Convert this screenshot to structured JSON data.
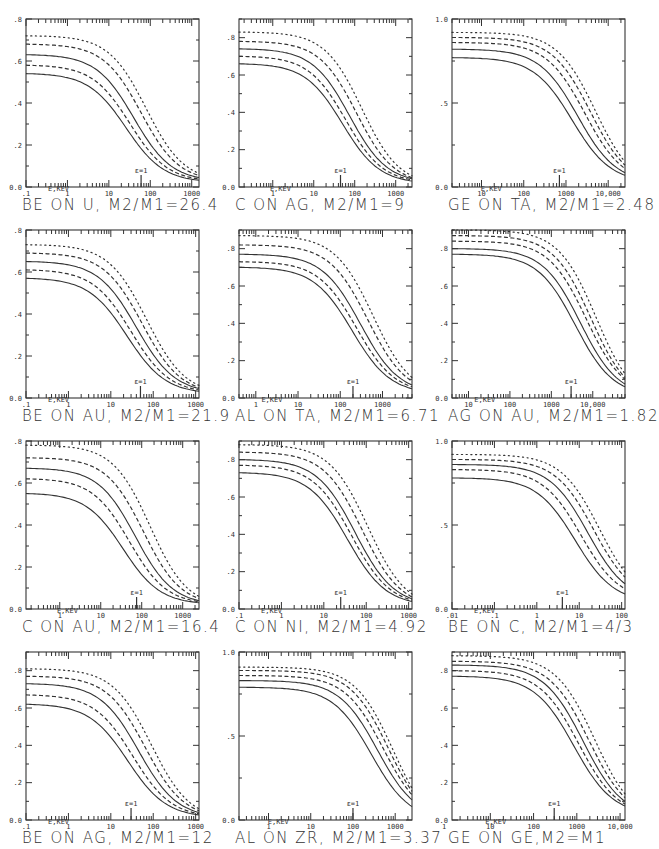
{
  "chart_data": [
    {
      "type": "line",
      "id": "p1",
      "title": "BE ON U, M2/M1=26.4",
      "xlabel": "E,KEV",
      "ylabel": "",
      "xscale": "log",
      "xlim": [
        0.1,
        1500
      ],
      "ylim": [
        0,
        0.8
      ],
      "xticks": [
        ".1",
        "1",
        "10",
        "100",
        "1000"
      ],
      "xtick_vals": [
        0.1,
        1,
        10,
        100,
        1000
      ],
      "yticks": [
        "0.0",
        ".2",
        ".4",
        ".6",
        ".8"
      ],
      "ytick_vals": [
        0,
        0.2,
        0.4,
        0.6,
        0.8
      ],
      "annotation": {
        "text": "ε=1",
        "x": 60
      },
      "series": [
        {
          "name": "curve-1",
          "style": "dotted",
          "start": 0.72,
          "end": 0.065,
          "mid": 80
        },
        {
          "name": "curve-2",
          "style": "dashed",
          "start": 0.68,
          "end": 0.055,
          "mid": 60
        },
        {
          "name": "curve-3",
          "style": "solid",
          "start": 0.63,
          "end": 0.045,
          "mid": 40
        },
        {
          "name": "curve-4",
          "style": "dashed",
          "start": 0.58,
          "end": 0.038,
          "mid": 32
        },
        {
          "name": "curve-5",
          "style": "solid",
          "start": 0.54,
          "end": 0.032,
          "mid": 26
        }
      ]
    },
    {
      "type": "line",
      "id": "p2",
      "title": "C ON AG, M2/M1=9",
      "xlabel": "E,KEV",
      "ylabel": "",
      "xscale": "log",
      "xlim": [
        0.15,
        2500
      ],
      "ylim": [
        0,
        0.9
      ],
      "xticks": [
        "1",
        "10",
        "100",
        "1000"
      ],
      "xtick_vals": [
        1,
        10,
        100,
        1000
      ],
      "yticks": [
        "0.0",
        ".2",
        ".4",
        ".6",
        ".8"
      ],
      "ytick_vals": [
        0,
        0.2,
        0.4,
        0.6,
        0.8
      ],
      "annotation": {
        "text": "ε=1",
        "x": 45
      },
      "series": [
        {
          "name": "curve-1",
          "style": "dotted",
          "start": 0.83,
          "end": 0.06,
          "mid": 150
        },
        {
          "name": "curve-2",
          "style": "dashed",
          "start": 0.78,
          "end": 0.05,
          "mid": 110
        },
        {
          "name": "curve-3",
          "style": "solid",
          "start": 0.74,
          "end": 0.045,
          "mid": 75
        },
        {
          "name": "curve-4",
          "style": "dashed",
          "start": 0.7,
          "end": 0.038,
          "mid": 60
        },
        {
          "name": "curve-5",
          "style": "solid",
          "start": 0.66,
          "end": 0.032,
          "mid": 50
        }
      ]
    },
    {
      "type": "line",
      "id": "p3",
      "title": "GE ON TA, M2/M1=2.48",
      "xlabel": "E,KEV",
      "ylabel": "",
      "xscale": "log",
      "xlim": [
        2,
        25000
      ],
      "ylim": [
        0,
        1.0
      ],
      "xticks": [
        "10",
        "100",
        "1000",
        "10,000"
      ],
      "xtick_vals": [
        10,
        100,
        1000,
        10000
      ],
      "yticks": [
        "0.0",
        ".5",
        "1.0"
      ],
      "ytick_vals": [
        0,
        0.5,
        1.0
      ],
      "annotation": {
        "text": "ε=1",
        "x": 700
      },
      "series": [
        {
          "name": "curve-1",
          "style": "dotted",
          "start": 0.92,
          "end": 0.15,
          "mid": 5000
        },
        {
          "name": "curve-2",
          "style": "dashed",
          "start": 0.89,
          "end": 0.13,
          "mid": 3800
        },
        {
          "name": "curve-3",
          "style": "dashed",
          "start": 0.86,
          "end": 0.11,
          "mid": 2800
        },
        {
          "name": "curve-4",
          "style": "solid",
          "start": 0.82,
          "end": 0.085,
          "mid": 1900
        },
        {
          "name": "curve-5",
          "style": "solid",
          "start": 0.77,
          "end": 0.07,
          "mid": 1400
        }
      ]
    },
    {
      "type": "line",
      "id": "p4",
      "title": "BE ON AU, M2/M1=21.9",
      "xlabel": "E,KEV",
      "ylabel": "",
      "xscale": "log",
      "xlim": [
        0.1,
        1200
      ],
      "ylim": [
        0,
        0.8
      ],
      "xticks": [
        ".1",
        "1",
        "10",
        "100",
        "1000"
      ],
      "xtick_vals": [
        0.1,
        1,
        10,
        100,
        1000
      ],
      "yticks": [
        "0.0",
        ".2",
        ".4",
        ".6",
        ".8"
      ],
      "ytick_vals": [
        0,
        0.2,
        0.4,
        0.6,
        0.8
      ],
      "annotation": {
        "text": "ε=1",
        "x": 50
      },
      "series": [
        {
          "name": "curve-1",
          "style": "dotted",
          "start": 0.73,
          "end": 0.06,
          "mid": 70
        },
        {
          "name": "curve-2",
          "style": "dashed",
          "start": 0.69,
          "end": 0.05,
          "mid": 55
        },
        {
          "name": "curve-3",
          "style": "solid",
          "start": 0.65,
          "end": 0.045,
          "mid": 40
        },
        {
          "name": "curve-4",
          "style": "dashed",
          "start": 0.61,
          "end": 0.038,
          "mid": 30
        },
        {
          "name": "curve-5",
          "style": "solid",
          "start": 0.57,
          "end": 0.032,
          "mid": 24
        }
      ]
    },
    {
      "type": "line",
      "id": "p5",
      "title": "AL ON TA, M2/M1=6.71",
      "xlabel": "E,KEV",
      "ylabel": "",
      "xscale": "log",
      "xlim": [
        0.4,
        5000
      ],
      "ylim": [
        0,
        0.9
      ],
      "xticks": [
        "1",
        "10",
        "100",
        "1000"
      ],
      "xtick_vals": [
        1,
        10,
        100,
        1000
      ],
      "yticks": [
        "0.0",
        ".2",
        ".4",
        ".6",
        ".8"
      ],
      "ytick_vals": [
        0,
        0.2,
        0.4,
        0.6,
        0.8
      ],
      "annotation": {
        "text": "ε=1",
        "x": 200
      },
      "series": [
        {
          "name": "curve-1",
          "style": "dotted",
          "start": 0.87,
          "end": 0.11,
          "mid": 600
        },
        {
          "name": "curve-2",
          "style": "dashed",
          "start": 0.82,
          "end": 0.09,
          "mid": 450
        },
        {
          "name": "curve-3",
          "style": "solid",
          "start": 0.77,
          "end": 0.07,
          "mid": 300
        },
        {
          "name": "curve-4",
          "style": "dashed",
          "start": 0.73,
          "end": 0.06,
          "mid": 240
        },
        {
          "name": "curve-5",
          "style": "solid",
          "start": 0.7,
          "end": 0.05,
          "mid": 190
        }
      ]
    },
    {
      "type": "line",
      "id": "p6",
      "title": "AG ON AU, M2/M1=1.82",
      "xlabel": "E,KEV",
      "ylabel": "",
      "xscale": "log",
      "xlim": [
        4,
        60000
      ],
      "ylim": [
        0,
        0.9
      ],
      "xticks": [
        "10",
        "100",
        "1000",
        "10,000"
      ],
      "xtick_vals": [
        10,
        100,
        1000,
        10000
      ],
      "yticks": [
        "0.0",
        ".2",
        ".4",
        ".6",
        ".8"
      ],
      "ytick_vals": [
        0,
        0.2,
        0.4,
        0.6,
        0.8
      ],
      "annotation": {
        "text": "ε=1",
        "x": 3000
      },
      "series": [
        {
          "name": "curve-1",
          "style": "dotted",
          "start": 0.9,
          "end": 0.13,
          "mid": 12000
        },
        {
          "name": "curve-2",
          "style": "dashed",
          "start": 0.87,
          "end": 0.11,
          "mid": 9000
        },
        {
          "name": "curve-3",
          "style": "dashed",
          "start": 0.84,
          "end": 0.1,
          "mid": 7000
        },
        {
          "name": "curve-4",
          "style": "solid",
          "start": 0.8,
          "end": 0.075,
          "mid": 5000
        },
        {
          "name": "curve-5",
          "style": "solid",
          "start": 0.77,
          "end": 0.06,
          "mid": 3800
        }
      ]
    },
    {
      "type": "line",
      "id": "p7",
      "title": "C ON AU, M2/M1=16.4",
      "xlabel": "E,KEV",
      "ylabel": "",
      "xscale": "log",
      "xlim": [
        0.15,
        2500
      ],
      "ylim": [
        0,
        0.8
      ],
      "xticks": [
        "1",
        "10",
        "100",
        "1000"
      ],
      "xtick_vals": [
        1,
        10,
        100,
        1000
      ],
      "yticks": [
        "0.0",
        ".2",
        ".4",
        ".6",
        ".8"
      ],
      "ytick_vals": [
        0,
        0.2,
        0.4,
        0.6,
        0.8
      ],
      "annotation": {
        "text": "ε=1",
        "x": 75
      },
      "series": [
        {
          "name": "curve-1",
          "style": "dotted",
          "start": 0.78,
          "end": 0.06,
          "mid": 160
        },
        {
          "name": "curve-2",
          "style": "dashed",
          "start": 0.72,
          "end": 0.05,
          "mid": 110
        },
        {
          "name": "curve-3",
          "style": "solid",
          "start": 0.67,
          "end": 0.04,
          "mid": 70
        },
        {
          "name": "curve-4",
          "style": "dashed",
          "start": 0.62,
          "end": 0.035,
          "mid": 50
        },
        {
          "name": "curve-5",
          "style": "solid",
          "start": 0.55,
          "end": 0.03,
          "mid": 35
        }
      ]
    },
    {
      "type": "line",
      "id": "p8",
      "title": "C ON NI, M2/M1=4.92",
      "xlabel": "E,KEV",
      "ylabel": "",
      "xscale": "log",
      "xlim": [
        0.1,
        1200
      ],
      "ylim": [
        0,
        0.9
      ],
      "xticks": [
        ".1",
        "1",
        "10",
        "100",
        "1000"
      ],
      "xtick_vals": [
        0.1,
        1,
        10,
        100,
        1000
      ],
      "yticks": [
        "0.0",
        ".2",
        ".4",
        ".6",
        ".8"
      ],
      "ytick_vals": [
        0,
        0.2,
        0.4,
        0.6,
        0.8
      ],
      "annotation": {
        "text": "ε=1",
        "x": 25
      },
      "series": [
        {
          "name": "curve-1",
          "style": "dotted",
          "start": 0.88,
          "end": 0.08,
          "mid": 110
        },
        {
          "name": "curve-2",
          "style": "dashed",
          "start": 0.84,
          "end": 0.065,
          "mid": 80
        },
        {
          "name": "curve-3",
          "style": "solid",
          "start": 0.8,
          "end": 0.055,
          "mid": 55
        },
        {
          "name": "curve-4",
          "style": "dashed",
          "start": 0.77,
          "end": 0.047,
          "mid": 45
        },
        {
          "name": "curve-5",
          "style": "solid",
          "start": 0.73,
          "end": 0.04,
          "mid": 36
        }
      ]
    },
    {
      "type": "line",
      "id": "p9",
      "title": "BE ON C, M2/M1=4/3",
      "xlabel": "E,KEV",
      "ylabel": "",
      "xscale": "log",
      "xlim": [
        0.01,
        120
      ],
      "ylim": [
        0,
        1.0
      ],
      "xticks": [
        ".01",
        ".1",
        "1",
        "10",
        "100"
      ],
      "xtick_vals": [
        0.01,
        0.1,
        1,
        10,
        100
      ],
      "yticks": [
        "0.0",
        ".5",
        "1.0"
      ],
      "ytick_vals": [
        0,
        0.5,
        1.0
      ],
      "annotation": {
        "text": "ε=1",
        "x": 4
      },
      "series": [
        {
          "name": "curve-1",
          "style": "dotted",
          "start": 0.92,
          "end": 0.22,
          "mid": 30
        },
        {
          "name": "curve-2",
          "style": "dashed",
          "start": 0.89,
          "end": 0.19,
          "mid": 22
        },
        {
          "name": "curve-3",
          "style": "solid",
          "start": 0.86,
          "end": 0.15,
          "mid": 16
        },
        {
          "name": "curve-4",
          "style": "dashed",
          "start": 0.83,
          "end": 0.12,
          "mid": 11
        },
        {
          "name": "curve-5",
          "style": "solid",
          "start": 0.78,
          "end": 0.09,
          "mid": 8
        }
      ]
    },
    {
      "type": "line",
      "id": "p10",
      "title": "BE ON AG, M2/M1=12",
      "xlabel": "E,KEV",
      "ylabel": "",
      "xscale": "log",
      "xlim": [
        0.1,
        1200
      ],
      "ylim": [
        0,
        0.9
      ],
      "xticks": [
        ".1",
        "1",
        "10",
        "100",
        "1000"
      ],
      "xtick_vals": [
        0.1,
        1,
        10,
        100,
        1000
      ],
      "yticks": [
        "0.0",
        ".2",
        ".4",
        ".6",
        ".8"
      ],
      "ytick_vals": [
        0,
        0.2,
        0.4,
        0.6,
        0.8
      ],
      "annotation": {
        "text": "ε=1",
        "x": 30
      },
      "series": [
        {
          "name": "curve-1",
          "style": "dotted",
          "start": 0.81,
          "end": 0.06,
          "mid": 90
        },
        {
          "name": "curve-2",
          "style": "dashed",
          "start": 0.77,
          "end": 0.05,
          "mid": 65
        },
        {
          "name": "curve-3",
          "style": "solid",
          "start": 0.73,
          "end": 0.04,
          "mid": 45
        },
        {
          "name": "curve-4",
          "style": "dashed",
          "start": 0.67,
          "end": 0.033,
          "mid": 33
        },
        {
          "name": "curve-5",
          "style": "solid",
          "start": 0.62,
          "end": 0.027,
          "mid": 25
        }
      ]
    },
    {
      "type": "line",
      "id": "p11",
      "title": "AL ON ZR, M2/M1=3.37",
      "xlabel": "E,KEV",
      "ylabel": "",
      "xscale": "log",
      "xlim": [
        0.2,
        2500
      ],
      "ylim": [
        0,
        1.0
      ],
      "xticks": [
        "1",
        "10",
        "100",
        "1000"
      ],
      "xtick_vals": [
        1,
        10,
        100,
        1000
      ],
      "yticks": [
        "0.0",
        ".5",
        "1.0"
      ],
      "ytick_vals": [
        0,
        0.5,
        1.0
      ],
      "annotation": {
        "text": "ε=1",
        "x": 100
      },
      "series": [
        {
          "name": "curve-1",
          "style": "dotted",
          "start": 0.91,
          "end": 0.19,
          "mid": 900
        },
        {
          "name": "curve-2",
          "style": "dashed",
          "start": 0.89,
          "end": 0.17,
          "mid": 700
        },
        {
          "name": "curve-3",
          "style": "dashed",
          "start": 0.86,
          "end": 0.15,
          "mid": 520
        },
        {
          "name": "curve-4",
          "style": "solid",
          "start": 0.83,
          "end": 0.12,
          "mid": 380
        },
        {
          "name": "curve-5",
          "style": "solid",
          "start": 0.79,
          "end": 0.08,
          "mid": 270
        }
      ]
    },
    {
      "type": "line",
      "id": "p12",
      "title": "GE ON GE,M2=M1",
      "xlabel": "E,KEV",
      "ylabel": "",
      "xscale": "log",
      "xlim": [
        1.3,
        13000
      ],
      "ylim": [
        0,
        0.9
      ],
      "xticks": [
        "1",
        "10",
        "100",
        "1000",
        "10,000"
      ],
      "xtick_vals": [
        1,
        10,
        100,
        1000,
        10000
      ],
      "yticks": [
        "0.0",
        ".2",
        ".4",
        ".6",
        ".8"
      ],
      "ytick_vals": [
        0,
        0.2,
        0.4,
        0.6,
        0.8
      ],
      "annotation": {
        "text": "ε=1",
        "x": 300
      },
      "series": [
        {
          "name": "curve-1",
          "style": "dotted",
          "start": 0.88,
          "end": 0.14,
          "mid": 2600
        },
        {
          "name": "curve-2",
          "style": "dashed",
          "start": 0.85,
          "end": 0.12,
          "mid": 1900
        },
        {
          "name": "curve-3",
          "style": "solid",
          "start": 0.83,
          "end": 0.1,
          "mid": 1400
        },
        {
          "name": "curve-4",
          "style": "dashed",
          "start": 0.8,
          "end": 0.085,
          "mid": 1100
        },
        {
          "name": "curve-5",
          "style": "solid",
          "start": 0.77,
          "end": 0.075,
          "mid": 850
        }
      ]
    }
  ],
  "panels_layout": {
    "columns": [
      26,
      239,
      452
    ],
    "rows": [
      19,
      230,
      441,
      652
    ],
    "plot_width": 173,
    "plot_height": 168
  },
  "colors": {
    "ink": "#333333",
    "background": "#ffffff"
  }
}
